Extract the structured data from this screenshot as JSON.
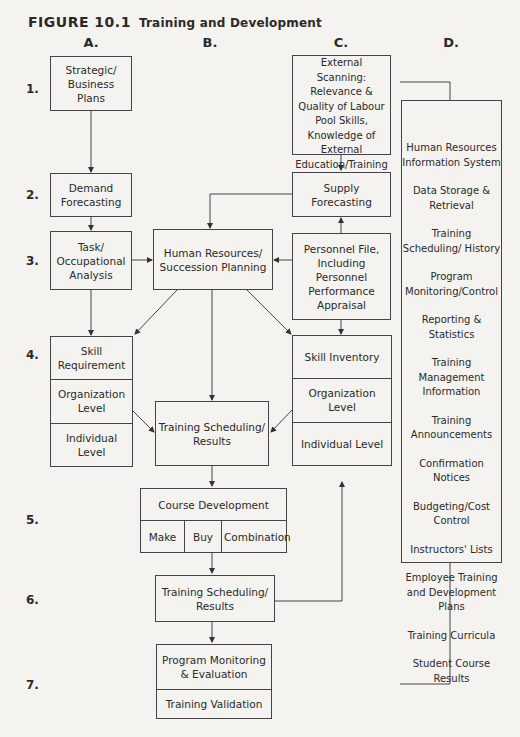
{
  "figure": {
    "label": "FIGURE 10.1",
    "title": "Training and Development"
  },
  "columns": [
    "A.",
    "B.",
    "C.",
    "D."
  ],
  "rows": [
    "1.",
    "2.",
    "3.",
    "4.",
    "5.",
    "6.",
    "7."
  ],
  "boxes": {
    "strategic": "Strategic/ Business Plans",
    "demand": "Demand Forecasting",
    "task": "Task/ Occupational Analysis",
    "skill_req": {
      "head": "Skill Requirement",
      "org": "Organization Level",
      "ind": "Individual Level"
    },
    "hr_succession": "Human Resources/ Succession Planning",
    "training_sched_1": "Training Scheduling/ Results",
    "course_dev": {
      "head": "Course Development",
      "make": "Make",
      "buy": "Buy",
      "combo": "Combination"
    },
    "training_sched_2": "Training Scheduling/ Results",
    "program_mon": {
      "head": "Program Monitoring & Evaluation",
      "validation": "Training Validation"
    },
    "external": "External Scanning: Relevance & Quality of Labour Pool Skills, Knowledge of External Education/Training",
    "supply": "Supply Forecasting",
    "personnel": "Personnel File, Including Personnel Performance Appraisal",
    "skill_inv": {
      "head": "Skill Inventory",
      "org": "Organization Level",
      "ind": "Individual Level"
    }
  },
  "hris_items": [
    "Human Resources Information System",
    "Data Storage & Retrieval",
    "Training Scheduling/ History",
    "Program Monitoring/Control",
    "Reporting & Statistics",
    "Training Management Information",
    "Training Announcements",
    "Confirmation Notices",
    "Budgeting/Cost Control",
    "Instructors' Lists",
    "Employee Training and Development Plans",
    "Training Curricula",
    "Student Course Results"
  ]
}
